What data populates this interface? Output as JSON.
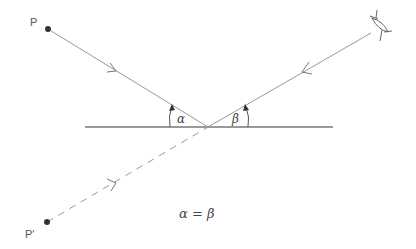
{
  "labels": {
    "point_p": "P",
    "point_p_image": "P′",
    "angle_incidence": "α",
    "angle_reflection": "β",
    "equation": "α = β"
  },
  "colors": {
    "line": "#888888",
    "dot": "#333333",
    "text": "#555555"
  }
}
